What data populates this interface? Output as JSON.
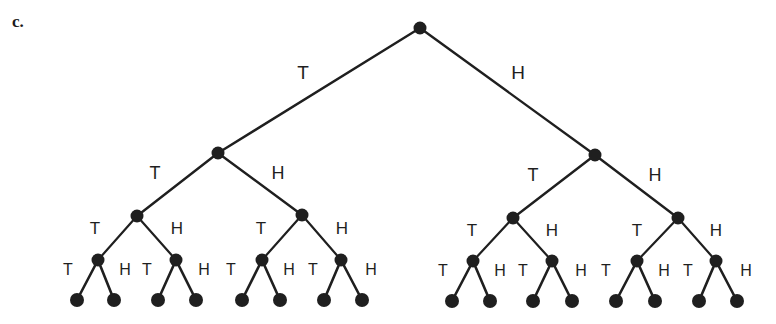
{
  "figure": {
    "part_label": "c.",
    "title": "",
    "background_color": "#ffffff",
    "ink_color": "#1f1f1f",
    "node_radius": 6.5,
    "leaf_radius": 7
  },
  "tree": {
    "branch_labels": [
      "T",
      "H"
    ],
    "levels": 4,
    "root": {
      "id": "root",
      "x": 420,
      "y": 28
    },
    "nodes": [
      {
        "id": "n-T",
        "level": 1,
        "x": 218,
        "y": 153,
        "parent": "root",
        "branch": "T"
      },
      {
        "id": "n-H",
        "level": 1,
        "x": 595,
        "y": 155,
        "parent": "root",
        "branch": "H"
      },
      {
        "id": "n-TT",
        "level": 2,
        "x": 137,
        "y": 216,
        "parent": "n-T",
        "branch": "T"
      },
      {
        "id": "n-TH",
        "level": 2,
        "x": 302,
        "y": 215,
        "parent": "n-T",
        "branch": "H"
      },
      {
        "id": "n-HT",
        "level": 2,
        "x": 513,
        "y": 218,
        "parent": "n-H",
        "branch": "T"
      },
      {
        "id": "n-HH",
        "level": 2,
        "x": 678,
        "y": 218,
        "parent": "n-H",
        "branch": "H"
      },
      {
        "id": "n-TTT",
        "level": 3,
        "x": 98,
        "y": 260,
        "parent": "n-TT",
        "branch": "T"
      },
      {
        "id": "n-TTH",
        "level": 3,
        "x": 176,
        "y": 260,
        "parent": "n-TT",
        "branch": "H"
      },
      {
        "id": "n-THT",
        "level": 3,
        "x": 262,
        "y": 260,
        "parent": "n-TH",
        "branch": "T"
      },
      {
        "id": "n-THH",
        "level": 3,
        "x": 341,
        "y": 260,
        "parent": "n-TH",
        "branch": "H"
      },
      {
        "id": "n-HTT",
        "level": 3,
        "x": 473,
        "y": 261,
        "parent": "n-HT",
        "branch": "T"
      },
      {
        "id": "n-HTH",
        "level": 3,
        "x": 552,
        "y": 261,
        "parent": "n-HT",
        "branch": "H"
      },
      {
        "id": "n-HHT",
        "level": 3,
        "x": 637,
        "y": 261,
        "parent": "n-HH",
        "branch": "T"
      },
      {
        "id": "n-HHH",
        "level": 3,
        "x": 716,
        "y": 261,
        "parent": "n-HH",
        "branch": "H"
      },
      {
        "id": "n-TTTT",
        "level": 4,
        "x": 77,
        "y": 300,
        "parent": "n-TTT",
        "branch": "T"
      },
      {
        "id": "n-TTTH",
        "level": 4,
        "x": 114,
        "y": 300,
        "parent": "n-TTT",
        "branch": "H"
      },
      {
        "id": "n-TTHT",
        "level": 4,
        "x": 158,
        "y": 300,
        "parent": "n-TTH",
        "branch": "T"
      },
      {
        "id": "n-TTHH",
        "level": 4,
        "x": 196,
        "y": 300,
        "parent": "n-TTH",
        "branch": "H"
      },
      {
        "id": "n-THTT",
        "level": 4,
        "x": 242,
        "y": 300,
        "parent": "n-THT",
        "branch": "T"
      },
      {
        "id": "n-THTH",
        "level": 4,
        "x": 280,
        "y": 300,
        "parent": "n-THT",
        "branch": "H"
      },
      {
        "id": "n-THHT",
        "level": 4,
        "x": 324,
        "y": 300,
        "parent": "n-THH",
        "branch": "T"
      },
      {
        "id": "n-THHH",
        "level": 4,
        "x": 362,
        "y": 300,
        "parent": "n-THH",
        "branch": "H"
      },
      {
        "id": "n-HTTT",
        "level": 4,
        "x": 452,
        "y": 301,
        "parent": "n-HTT",
        "branch": "T"
      },
      {
        "id": "n-HTTH",
        "level": 4,
        "x": 490,
        "y": 301,
        "parent": "n-HTT",
        "branch": "H"
      },
      {
        "id": "n-HTHT",
        "level": 4,
        "x": 533,
        "y": 301,
        "parent": "n-HTH",
        "branch": "T"
      },
      {
        "id": "n-HTHH",
        "level": 4,
        "x": 572,
        "y": 301,
        "parent": "n-HTH",
        "branch": "H"
      },
      {
        "id": "n-HHTT",
        "level": 4,
        "x": 616,
        "y": 301,
        "parent": "n-HHT",
        "branch": "T"
      },
      {
        "id": "n-HHTH",
        "level": 4,
        "x": 655,
        "y": 301,
        "parent": "n-HHT",
        "branch": "H"
      },
      {
        "id": "n-HHHT",
        "level": 4,
        "x": 699,
        "y": 301,
        "parent": "n-HHH",
        "branch": "T"
      },
      {
        "id": "n-HHHH",
        "level": 4,
        "x": 737,
        "y": 301,
        "parent": "n-HHH",
        "branch": "H"
      }
    ],
    "edge_labels": [
      {
        "id": "lbl-T",
        "level": 1,
        "text": "T",
        "x": 303,
        "y": 72
      },
      {
        "id": "lbl-H",
        "level": 1,
        "text": "H",
        "x": 518,
        "y": 72
      },
      {
        "id": "lbl-TT",
        "level": 2,
        "text": "T",
        "x": 155,
        "y": 173
      },
      {
        "id": "lbl-TH",
        "level": 2,
        "text": "H",
        "x": 278,
        "y": 173
      },
      {
        "id": "lbl-HT",
        "level": 2,
        "text": "T",
        "x": 533,
        "y": 175
      },
      {
        "id": "lbl-HH",
        "level": 2,
        "text": "H",
        "x": 655,
        "y": 175
      },
      {
        "id": "lbl-TTT",
        "level": 3,
        "text": "T",
        "x": 95,
        "y": 228
      },
      {
        "id": "lbl-TTH",
        "level": 3,
        "text": "H",
        "x": 177,
        "y": 228
      },
      {
        "id": "lbl-THT",
        "level": 3,
        "text": "T",
        "x": 261,
        "y": 228
      },
      {
        "id": "lbl-THH",
        "level": 3,
        "text": "H",
        "x": 342,
        "y": 228
      },
      {
        "id": "lbl-HTT",
        "level": 3,
        "text": "T",
        "x": 472,
        "y": 230
      },
      {
        "id": "lbl-HTH",
        "level": 3,
        "text": "H",
        "x": 552,
        "y": 230
      },
      {
        "id": "lbl-HHT",
        "level": 3,
        "text": "T",
        "x": 637,
        "y": 230
      },
      {
        "id": "lbl-HHH",
        "level": 3,
        "text": "H",
        "x": 716,
        "y": 230
      },
      {
        "id": "lbl-TTTT",
        "level": 4,
        "text": "T",
        "x": 68,
        "y": 270
      },
      {
        "id": "lbl-TTTH",
        "level": 4,
        "text": "H",
        "x": 125,
        "y": 270
      },
      {
        "id": "lbl-TTHT",
        "level": 4,
        "text": "T",
        "x": 147,
        "y": 270
      },
      {
        "id": "lbl-TTHH",
        "level": 4,
        "text": "H",
        "x": 204,
        "y": 270
      },
      {
        "id": "lbl-THTT",
        "level": 4,
        "text": "T",
        "x": 231,
        "y": 270
      },
      {
        "id": "lbl-THTH",
        "level": 4,
        "text": "H",
        "x": 289,
        "y": 270
      },
      {
        "id": "lbl-THHT",
        "level": 4,
        "text": "T",
        "x": 313,
        "y": 270
      },
      {
        "id": "lbl-THHH",
        "level": 4,
        "text": "H",
        "x": 371,
        "y": 270
      },
      {
        "id": "lbl-HTTT",
        "level": 4,
        "text": "T",
        "x": 443,
        "y": 271
      },
      {
        "id": "lbl-HTTH",
        "level": 4,
        "text": "H",
        "x": 500,
        "y": 271
      },
      {
        "id": "lbl-HTHT",
        "level": 4,
        "text": "T",
        "x": 523,
        "y": 271
      },
      {
        "id": "lbl-HTHH",
        "level": 4,
        "text": "H",
        "x": 581,
        "y": 271
      },
      {
        "id": "lbl-HHTT",
        "level": 4,
        "text": "T",
        "x": 606,
        "y": 271
      },
      {
        "id": "lbl-HHTH",
        "level": 4,
        "text": "H",
        "x": 664,
        "y": 271
      },
      {
        "id": "lbl-HHHT",
        "level": 4,
        "text": "T",
        "x": 688,
        "y": 271
      },
      {
        "id": "lbl-HHHH",
        "level": 4,
        "text": "H",
        "x": 746,
        "y": 271
      }
    ]
  }
}
